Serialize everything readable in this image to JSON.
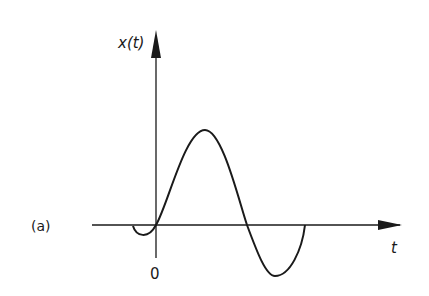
{
  "figure": {
    "panel_label": "(a)",
    "y_axis_label": "x(t)",
    "x_axis_label": "t",
    "origin_label": "0",
    "colors": {
      "line": "#1a1a1a",
      "background": "#ffffff"
    }
  }
}
